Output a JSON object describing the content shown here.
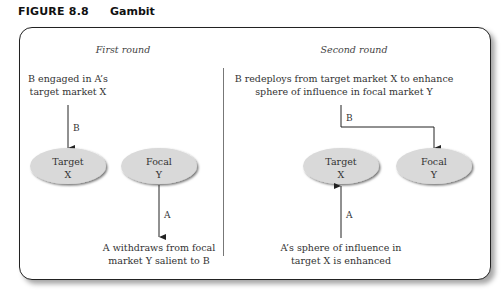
{
  "figure": {
    "label": "FIGURE 8.8",
    "title": "Gambit"
  },
  "first_round": {
    "heading": "First round",
    "top_text": [
      "B engaged in A’s",
      "target market X"
    ],
    "arrow_label": "B",
    "nodes": [
      {
        "line1": "Target",
        "line2": "X"
      },
      {
        "line1": "Focal",
        "line2": "Y"
      }
    ],
    "bottom_arrow_label": "A",
    "bottom_text": [
      "A withdraws from focal",
      "market Y salient to B"
    ]
  },
  "second_round": {
    "heading": "Second round",
    "top_text": [
      "B redeploys from target market X to enhance",
      "sphere of influence in focal market Y"
    ],
    "arrow_label": "B",
    "nodes": [
      {
        "line1": "Target",
        "line2": "X"
      },
      {
        "line1": "Focal",
        "line2": "Y"
      }
    ],
    "bottom_arrow_label": "A",
    "bottom_text": [
      "A’s sphere of influence in",
      "target X is enhanced"
    ]
  },
  "colors": {
    "node_fill": "#d9d9d9",
    "line": "#222222"
  }
}
